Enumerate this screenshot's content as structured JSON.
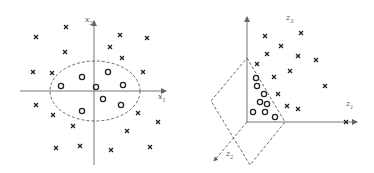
{
  "figure": {
    "left_panel": {
      "title": "",
      "axis_labels": {
        "horizontal": "x1",
        "vertical": "x2"
      },
      "axes": {
        "origin": [
          94,
          91
        ],
        "h_from": 20,
        "h_to": 166,
        "v_from": 165,
        "v_to": 21
      },
      "ellipse": {
        "cx": 95,
        "cy": 91,
        "rx": 45,
        "ry": 30,
        "style": "dashed"
      },
      "crosses": [
        [
          66,
          27
        ],
        [
          36,
          37
        ],
        [
          120,
          35
        ],
        [
          147,
          38
        ],
        [
          65,
          52
        ],
        [
          110,
          47
        ],
        [
          122,
          58
        ],
        [
          33,
          72
        ],
        [
          52,
          73
        ],
        [
          143,
          72
        ],
        [
          36,
          105
        ],
        [
          53,
          115
        ],
        [
          138,
          113
        ],
        [
          158,
          122
        ],
        [
          73,
          126
        ],
        [
          127,
          131
        ],
        [
          56,
          148
        ],
        [
          80,
          146
        ],
        [
          111,
          150
        ],
        [
          150,
          147
        ]
      ],
      "circles": [
        [
          82,
          77
        ],
        [
          108,
          72
        ],
        [
          61,
          86
        ],
        [
          96,
          87
        ],
        [
          123,
          85
        ],
        [
          103,
          99
        ],
        [
          121,
          105
        ],
        [
          82,
          111
        ]
      ]
    },
    "right_panel": {
      "axis_labels": {
        "z1": "z1",
        "z2": "z2",
        "z3": "z3"
      },
      "axes": {
        "origin": [
          247,
          122
        ],
        "z1_to": [
          357,
          122
        ],
        "z3_to": [
          247,
          17
        ],
        "z2_to": [
          214,
          161
        ]
      },
      "plane": {
        "points": [
          [
            247,
            58
          ],
          [
            285,
            122
          ],
          [
            250,
            165
          ],
          [
            211,
            101
          ]
        ],
        "style": "dashed"
      },
      "crosses": [
        [
          265,
          36
        ],
        [
          301,
          33
        ],
        [
          281,
          46
        ],
        [
          267,
          54
        ],
        [
          298,
          56
        ],
        [
          316,
          60
        ],
        [
          257,
          64
        ],
        [
          290,
          71
        ],
        [
          274,
          77
        ],
        [
          325,
          86
        ],
        [
          278,
          94
        ],
        [
          287,
          106
        ],
        [
          298,
          109
        ],
        [
          346,
          122
        ]
      ],
      "circles": [
        [
          256,
          78
        ],
        [
          257,
          86
        ],
        [
          264,
          94
        ],
        [
          260,
          102
        ],
        [
          267,
          104
        ],
        [
          253,
          112
        ],
        [
          265,
          112
        ],
        [
          275,
          117
        ]
      ]
    },
    "labels": {
      "x1": {
        "base": "x",
        "sub": "1"
      },
      "x2": {
        "base": "x",
        "sub": "2"
      },
      "z1": {
        "base": "z",
        "sub": "1"
      },
      "z2": {
        "base": "z",
        "sub": "2"
      },
      "z3": {
        "base": "z",
        "sub": "3"
      }
    },
    "colors": {
      "axis": "#777777",
      "marker": "#222222",
      "dashed": "#444444"
    }
  }
}
